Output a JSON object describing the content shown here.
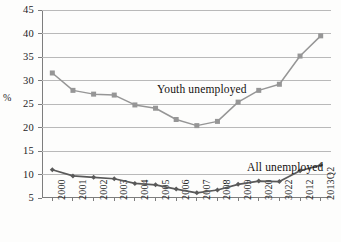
{
  "axis": {
    "y_label": "%",
    "y_ticks": [
      "45",
      "40",
      "35",
      "30",
      "25",
      "20",
      "15",
      "10",
      "5"
    ],
    "x_ticks": [
      "2000",
      "2001",
      "2002",
      "2003",
      "2004",
      "2005",
      "2006",
      "2007",
      "2008",
      "2009",
      "3020",
      "3022",
      "2012",
      "2013Q2"
    ]
  },
  "annotations": {
    "youth": "Youth unemployed",
    "all": "All unemployed"
  },
  "colors": {
    "youth_series": "#969696",
    "all_series": "#595959",
    "gridline": "#b9b9b9",
    "axis": "#7d7d7d",
    "text": "#1c1c1c",
    "background": "#fdfdfc"
  },
  "chart_data": {
    "type": "line",
    "title": "",
    "xlabel": "",
    "ylabel": "%",
    "ylim": [
      5,
      45
    ],
    "ytick_step": 5,
    "grid": true,
    "legend": "inline-annotations",
    "categories": [
      "2000",
      "2001",
      "2002",
      "2003",
      "2004",
      "2005",
      "2006",
      "2007",
      "2008",
      "2009",
      "3020",
      "3022",
      "2012",
      "2013Q2"
    ],
    "series": [
      {
        "name": "Youth unemployed",
        "color": "#969696",
        "marker": "square",
        "values": [
          31.6,
          27.9,
          27.1,
          26.9,
          24.8,
          24.1,
          21.7,
          20.4,
          21.3,
          25.4,
          27.9,
          29.2,
          35.2,
          39.5
        ]
      },
      {
        "name": "All unemployed",
        "color": "#595959",
        "marker": "diamond",
        "values": [
          11.0,
          9.7,
          9.4,
          9.1,
          8.1,
          7.8,
          6.9,
          6.1,
          6.7,
          7.9,
          8.6,
          8.5,
          10.8,
          12.0
        ]
      }
    ]
  }
}
